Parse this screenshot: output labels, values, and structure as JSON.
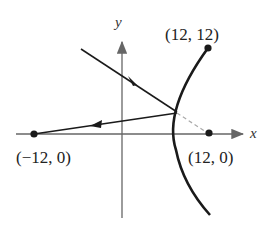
{
  "diagram": {
    "axes": {
      "x_label": "x",
      "y_label": "y"
    },
    "points": [
      {
        "id": "left-focus",
        "label": "(−12,  0)",
        "x": -12,
        "y": 0
      },
      {
        "id": "right-focus",
        "label": "(12,  0)",
        "x": 12,
        "y": 0
      },
      {
        "id": "curve-endpoint",
        "label": "(12,  12)",
        "x": 12,
        "y": 12
      }
    ],
    "elements": [
      "hyperbola branch",
      "incoming ray",
      "reflected ray",
      "dashed extension to focus"
    ],
    "colors": {
      "stroke": "#1a1a1a",
      "axis": "#666666",
      "dashed": "#aaaaaa"
    }
  }
}
